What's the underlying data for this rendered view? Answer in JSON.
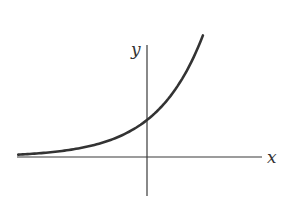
{
  "chart_data": {
    "type": "line",
    "title": "",
    "xlabel": "x",
    "ylabel": "y",
    "function": "y = e^x",
    "x": [
      -2.74,
      -2.5,
      -2.0,
      -1.5,
      -1.0,
      -0.5,
      0.0,
      0.25,
      0.5,
      0.75,
      1.0,
      1.19
    ],
    "series": [
      {
        "name": "exponential curve",
        "values": [
          0.065,
          0.082,
          0.135,
          0.223,
          0.368,
          0.607,
          1.0,
          1.284,
          1.649,
          2.117,
          2.718,
          3.287
        ]
      }
    ],
    "xlim": [
      -2.78,
      2.45
    ],
    "ylim": [
      -1.0,
      3.03
    ],
    "grid": false,
    "legend": null,
    "annotations": [
      "y-intercept at (0, 1)"
    ]
  },
  "labels": {
    "x_axis": "x",
    "y_axis": "y"
  },
  "colors": {
    "axis": "#3a3a3a",
    "curve": "#333333",
    "background": "#ffffff"
  }
}
